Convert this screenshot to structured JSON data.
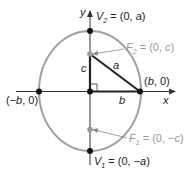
{
  "diagram": {
    "type": "ellipse-foci",
    "colors": {
      "ellipse": "#a0a0a0",
      "axes": "#333333",
      "points": "#111111",
      "foci": "#9a9a9a",
      "triangle": "#222222",
      "focus_labels": "#9a9a9a"
    },
    "axes": {
      "x_label": "x",
      "y_label": "y"
    },
    "points": {
      "v2": {
        "name": "V",
        "sub": "2",
        "rest": " = (0, ",
        "var": "a",
        "close": ")"
      },
      "v1": {
        "name": "V",
        "sub": "1",
        "rest": " = (0, −",
        "var": "a",
        "close": ")"
      },
      "f2": {
        "name": "F",
        "sub": "2",
        "rest": " = (0, ",
        "var": "c",
        "close": ")"
      },
      "f1": {
        "name": "F",
        "sub": "1",
        "rest": " = (0, −",
        "var": "c",
        "close": ")"
      },
      "right": {
        "open": "(",
        "var": "b",
        "rest": ", 0)"
      },
      "left": {
        "open": "(−",
        "var": "b",
        "rest": ", 0)"
      }
    },
    "segments": {
      "c": "c",
      "a": "a",
      "b": "b"
    }
  }
}
